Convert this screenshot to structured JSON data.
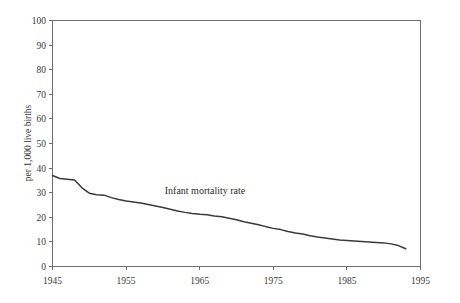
{
  "chart_data": {
    "type": "line",
    "title": "",
    "xlabel": "",
    "ylabel": "per 1,000 live births",
    "annotation": "Infant mortality rate",
    "grid": false,
    "legend_position": "inline-annotation",
    "xlim": [
      1945,
      1995
    ],
    "ylim": [
      0,
      100
    ],
    "xticks": [
      1945,
      1955,
      1965,
      1975,
      1985,
      1995
    ],
    "xtick_labels": [
      "1945",
      "1955",
      "1965",
      "1975",
      "1985",
      "1995"
    ],
    "yticks": [
      0,
      10,
      20,
      30,
      40,
      50,
      60,
      70,
      80,
      90,
      100
    ],
    "ytick_labels": [
      "0",
      "10",
      "20",
      "30",
      "40",
      "50",
      "60",
      "70",
      "80",
      "90",
      "100"
    ],
    "series": [
      {
        "name": "Infant mortality rate",
        "color": "#3a3a3a",
        "x": [
          1945,
          1946,
          1947,
          1948,
          1949,
          1950,
          1951,
          1952,
          1953,
          1954,
          1955,
          1956,
          1957,
          1958,
          1959,
          1960,
          1961,
          1962,
          1963,
          1964,
          1965,
          1966,
          1967,
          1968,
          1969,
          1970,
          1971,
          1972,
          1973,
          1974,
          1975,
          1976,
          1977,
          1978,
          1979,
          1980,
          1981,
          1982,
          1983,
          1984,
          1985,
          1986,
          1987,
          1988,
          1989,
          1990,
          1991,
          1992,
          1993
        ],
        "values": [
          37.0,
          35.8,
          35.5,
          35.2,
          32.0,
          29.8,
          29.2,
          29.0,
          28.0,
          27.2,
          26.6,
          26.2,
          25.8,
          25.2,
          24.6,
          24.0,
          23.3,
          22.6,
          22.0,
          21.5,
          21.2,
          21.0,
          20.5,
          20.2,
          19.6,
          19.0,
          18.2,
          17.6,
          17.0,
          16.2,
          15.5,
          15.0,
          14.2,
          13.6,
          13.2,
          12.5,
          12.0,
          11.6,
          11.2,
          10.8,
          10.6,
          10.4,
          10.2,
          10.0,
          9.8,
          9.6,
          9.2,
          8.5,
          7.2
        ]
      }
    ]
  },
  "axes": {
    "y_title": "per 1,000 live births"
  }
}
